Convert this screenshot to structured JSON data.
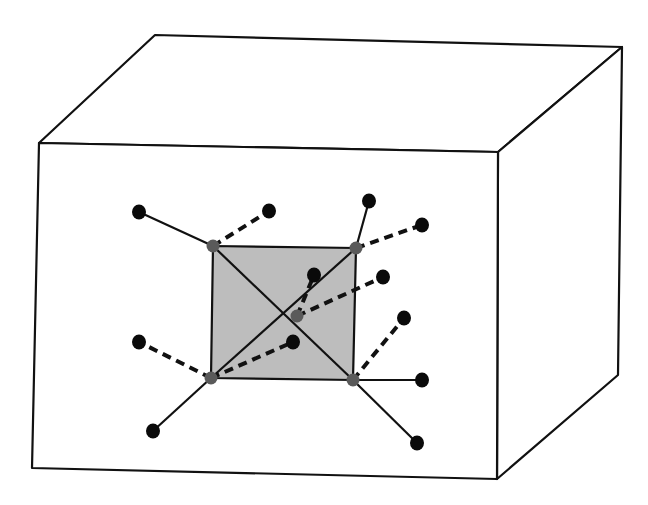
{
  "diagram": {
    "colors": {
      "background": "#ffffff",
      "cube_stroke": "#111111",
      "square_fill": "#bdbdbd",
      "inner_node": "#5a5a5a",
      "outer_node": "#0a0a0a",
      "bond": "#111111"
    },
    "cube": {
      "front_face": [
        [
          39,
          143
        ],
        [
          498,
          152
        ],
        [
          497,
          479
        ],
        [
          32,
          468
        ]
      ],
      "top_face": [
        [
          39,
          143
        ],
        [
          155,
          35
        ],
        [
          622,
          47
        ],
        [
          498,
          152
        ]
      ],
      "side_face": [
        [
          498,
          152
        ],
        [
          622,
          47
        ],
        [
          618,
          375
        ],
        [
          497,
          479
        ]
      ]
    },
    "square": {
      "corners": [
        [
          213,
          246
        ],
        [
          356,
          248
        ],
        [
          353,
          380
        ],
        [
          211,
          378
        ]
      ],
      "center": [
        297,
        316
      ]
    },
    "inner_nodes": [
      {
        "id": "tl",
        "x": 213,
        "y": 246
      },
      {
        "id": "tr",
        "x": 356,
        "y": 248
      },
      {
        "id": "br",
        "x": 353,
        "y": 380
      },
      {
        "id": "bl",
        "x": 211,
        "y": 378
      },
      {
        "id": "center",
        "x": 297,
        "y": 316
      }
    ],
    "outer_nodes": [
      {
        "id": "o1",
        "x": 139,
        "y": 212
      },
      {
        "id": "o2",
        "x": 269,
        "y": 211
      },
      {
        "id": "o3",
        "x": 369,
        "y": 201
      },
      {
        "id": "o4",
        "x": 422,
        "y": 225
      },
      {
        "id": "o5",
        "x": 314,
        "y": 275
      },
      {
        "id": "o6",
        "x": 383,
        "y": 277
      },
      {
        "id": "o7",
        "x": 404,
        "y": 318
      },
      {
        "id": "o8",
        "x": 139,
        "y": 342
      },
      {
        "id": "o9",
        "x": 293,
        "y": 342
      },
      {
        "id": "o10",
        "x": 422,
        "y": 380
      },
      {
        "id": "o11",
        "x": 153,
        "y": 431
      },
      {
        "id": "o12",
        "x": 417,
        "y": 443
      }
    ],
    "solid_bonds": [
      [
        "tl",
        "o1"
      ],
      [
        "tr",
        "o3"
      ],
      [
        "br",
        "o10"
      ],
      [
        "br",
        "o12"
      ],
      [
        "bl",
        "o11"
      ],
      [
        "tl",
        "br"
      ],
      [
        "tr",
        "bl"
      ]
    ],
    "dashed_bonds": [
      [
        "tl",
        "o2"
      ],
      [
        "tr",
        "o4"
      ],
      [
        "center",
        "o5"
      ],
      [
        "center",
        "o6"
      ],
      [
        "br",
        "o7"
      ],
      [
        "bl",
        "o8"
      ],
      [
        "bl",
        "o9"
      ]
    ]
  }
}
